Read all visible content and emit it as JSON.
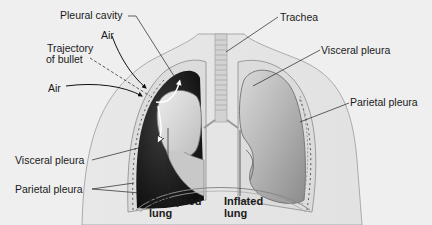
{
  "diagram": {
    "labels": {
      "pleural_cavity": "Pleural cavity",
      "air_top": "Air",
      "trajectory_line1": "Trajectory",
      "trajectory_line2": "of bullet",
      "air_left": "Air",
      "visceral_pleura_left": "Visceral pleura",
      "parietal_pleura_left": "Parietal pleura",
      "collapsed_lung_line1": "Collapsed",
      "collapsed_lung_line2": "lung",
      "inflated_lung_line1": "Inflated",
      "inflated_lung_line2": "lung",
      "trachea": "Trachea",
      "visceral_pleura_right": "Visceral pleura",
      "parietal_pleura_right": "Parietal pleura"
    },
    "colors": {
      "background": "#efefef",
      "body_outline": "#9a9a9a",
      "chest_fill": "#e6e6e6",
      "pleural_space_dark": "#1e1e1e",
      "lung_fill": "#bdbdbd",
      "collapsed_lung_fill": "#d4d4d4",
      "trachea": "#cfcfcf",
      "leader_line": "#222222"
    }
  }
}
